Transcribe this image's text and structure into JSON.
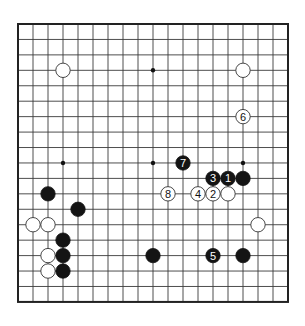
{
  "board": {
    "size": 19,
    "origin_x": 18,
    "origin_y": 24,
    "spacing_x": 15,
    "spacing_y": 15.44,
    "stone_radius": 7.2,
    "colors": {
      "line": "#3a3a3a",
      "black": "#141414",
      "white": "#ffffff",
      "background": "#ffffff"
    }
  },
  "hoshi": [
    {
      "col": 3,
      "row": 3
    },
    {
      "col": 9,
      "row": 3
    },
    {
      "col": 15,
      "row": 3
    },
    {
      "col": 3,
      "row": 9
    },
    {
      "col": 9,
      "row": 9
    },
    {
      "col": 15,
      "row": 9
    },
    {
      "col": 3,
      "row": 15
    },
    {
      "col": 9,
      "row": 15
    },
    {
      "col": 15,
      "row": 15
    }
  ],
  "stones": [
    {
      "color": "white",
      "col": 3,
      "row": 3,
      "label": ""
    },
    {
      "color": "white",
      "col": 15,
      "row": 3,
      "label": ""
    },
    {
      "color": "white",
      "col": 15,
      "row": 6,
      "label": "6"
    },
    {
      "color": "black",
      "col": 11,
      "row": 9,
      "label": "7"
    },
    {
      "color": "black",
      "col": 13,
      "row": 10,
      "label": "3"
    },
    {
      "color": "black",
      "col": 14,
      "row": 10,
      "label": "1"
    },
    {
      "color": "black",
      "col": 15,
      "row": 10,
      "label": ""
    },
    {
      "color": "white",
      "col": 10,
      "row": 11,
      "label": "8"
    },
    {
      "color": "white",
      "col": 12,
      "row": 11,
      "label": "4"
    },
    {
      "color": "white",
      "col": 13,
      "row": 11,
      "label": "2"
    },
    {
      "color": "white",
      "col": 14,
      "row": 11,
      "label": ""
    },
    {
      "color": "black",
      "col": 2,
      "row": 11,
      "label": ""
    },
    {
      "color": "black",
      "col": 4,
      "row": 12,
      "label": ""
    },
    {
      "color": "white",
      "col": 1,
      "row": 13,
      "label": ""
    },
    {
      "color": "white",
      "col": 2,
      "row": 13,
      "label": ""
    },
    {
      "color": "white",
      "col": 16,
      "row": 13,
      "label": ""
    },
    {
      "color": "black",
      "col": 3,
      "row": 14,
      "label": ""
    },
    {
      "color": "white",
      "col": 2,
      "row": 15,
      "label": ""
    },
    {
      "color": "black",
      "col": 3,
      "row": 15,
      "label": ""
    },
    {
      "color": "black",
      "col": 9,
      "row": 15,
      "label": ""
    },
    {
      "color": "black",
      "col": 13,
      "row": 15,
      "label": "5"
    },
    {
      "color": "black",
      "col": 15,
      "row": 15,
      "label": ""
    },
    {
      "color": "white",
      "col": 2,
      "row": 16,
      "label": ""
    },
    {
      "color": "black",
      "col": 3,
      "row": 16,
      "label": ""
    }
  ]
}
